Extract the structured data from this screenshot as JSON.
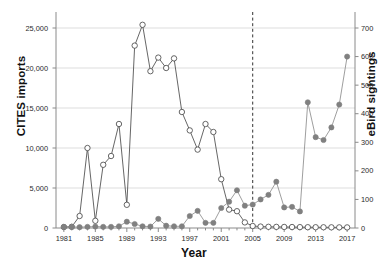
{
  "chart_data": {
    "type": "line",
    "title": "",
    "xlabel": "Year",
    "ylabel": "CITES imports",
    "ylabel_right": "eBird sightings",
    "xlim": [
      1980,
      2018
    ],
    "ylim": [
      0,
      26500
    ],
    "ylim_right": [
      0,
      742
    ],
    "grid": "horizontal",
    "legend": "none",
    "x": [
      1981,
      1982,
      1983,
      1984,
      1985,
      1986,
      1987,
      1988,
      1989,
      1990,
      1991,
      1992,
      1993,
      1994,
      1995,
      1996,
      1997,
      1998,
      1999,
      2000,
      2001,
      2002,
      2003,
      2004,
      2005,
      2006,
      2007,
      2008,
      2009,
      2010,
      2011,
      2012,
      2013,
      2014,
      2015,
      2016,
      2017
    ],
    "xticks": [
      1981,
      1985,
      1989,
      1993,
      1997,
      2001,
      2005,
      2009,
      2013,
      2017
    ],
    "xtick_labels": [
      "1981",
      "1985",
      "1989",
      "1993",
      "1997",
      "2001",
      "2005",
      "2009",
      "2013",
      "2017"
    ],
    "yticks_left": [
      0,
      5000,
      10000,
      15000,
      20000,
      25000
    ],
    "ytick_labels_left": [
      "0",
      "5,000",
      "10,000",
      "15,000",
      "20,000",
      "25,000"
    ],
    "yticks_right": [
      0,
      100,
      200,
      300,
      400,
      500,
      600,
      700
    ],
    "ytick_labels_right": [
      "0",
      "100",
      "200",
      "300",
      "400",
      "500",
      "600",
      "700"
    ],
    "annotations": [
      {
        "name": "vertical-dashed-line",
        "type": "vline",
        "x": 2005,
        "style": "dashed"
      }
    ],
    "series": [
      {
        "name": "CITES imports",
        "axis": "left",
        "marker": "open-circle",
        "marker_fill": "#ffffff",
        "color": "#4a4a4a",
        "values": [
          120,
          150,
          1500,
          10000,
          900,
          7900,
          9000,
          13000,
          2900,
          22800,
          25400,
          19600,
          21300,
          20000,
          21200,
          14500,
          12200,
          9800,
          13000,
          12000,
          6100,
          2300,
          2100,
          700,
          250,
          180,
          150,
          140,
          130,
          120,
          110,
          100,
          95,
          90,
          85,
          80,
          75
        ]
      },
      {
        "name": "eBird sightings",
        "axis": "right",
        "marker": "filled-circle",
        "marker_fill": "#808080",
        "color": "#8c8c8c",
        "values": [
          4,
          4,
          3,
          4,
          5,
          4,
          4,
          6,
          22,
          14,
          6,
          5,
          32,
          8,
          6,
          6,
          42,
          60,
          18,
          18,
          70,
          92,
          132,
          78,
          82,
          100,
          116,
          162,
          72,
          74,
          58,
          440,
          318,
          308,
          352,
          432,
          600
        ]
      }
    ]
  },
  "axes": {
    "left_title": "CITES imports",
    "right_title": "eBird sightings",
    "x_title": "Year"
  },
  "colors": {
    "grid": "#d9d9d9",
    "axis": "#8a8a8a",
    "cites_line": "#555555",
    "ebird_line": "#9a9a9a",
    "ebird_marker": "#7d7d7d",
    "dashed_line": "#333333"
  }
}
